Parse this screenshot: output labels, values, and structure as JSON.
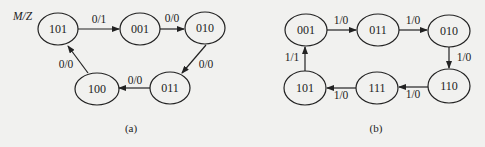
{
  "diagram_a": {
    "legend": "M/Z",
    "caption": "(a)",
    "states": [
      {
        "id": "101",
        "label": "101"
      },
      {
        "id": "001",
        "label": "001"
      },
      {
        "id": "010",
        "label": "010"
      },
      {
        "id": "011",
        "label": "011"
      },
      {
        "id": "100",
        "label": "100"
      }
    ],
    "transitions": [
      {
        "from": "101",
        "to": "001",
        "label": "0/1"
      },
      {
        "from": "001",
        "to": "010",
        "label": "0/0"
      },
      {
        "from": "010",
        "to": "011",
        "label": "0/0"
      },
      {
        "from": "011",
        "to": "100",
        "label": "0/0"
      },
      {
        "from": "100",
        "to": "101",
        "label": "0/0"
      }
    ]
  },
  "diagram_b": {
    "caption": "(b)",
    "states": [
      {
        "id": "001",
        "label": "001"
      },
      {
        "id": "011",
        "label": "011"
      },
      {
        "id": "010",
        "label": "010"
      },
      {
        "id": "110",
        "label": "110"
      },
      {
        "id": "111",
        "label": "111"
      },
      {
        "id": "101",
        "label": "101"
      }
    ],
    "transitions": [
      {
        "from": "001",
        "to": "011",
        "label": "1/0"
      },
      {
        "from": "011",
        "to": "010",
        "label": "1/0"
      },
      {
        "from": "010",
        "to": "110",
        "label": "1/0"
      },
      {
        "from": "110",
        "to": "111",
        "label": "1/0"
      },
      {
        "from": "111",
        "to": "101",
        "label": "1/0"
      },
      {
        "from": "101",
        "to": "001",
        "label": "1/1"
      }
    ]
  }
}
